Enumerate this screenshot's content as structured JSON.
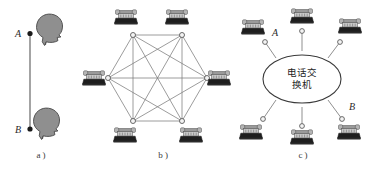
{
  "figure": {
    "title": "",
    "background_color": "#ffffff",
    "line_color": "#6e6e6e",
    "node_stroke_color": "#5a5a5a",
    "node_fill_color": "#f2f2f2",
    "head_fill_color": "#8a8a8a",
    "head_stroke_color": "#4a4a4a",
    "phone_body_color": "#1c1c1c",
    "phone_handset_color": "#b9b9b9",
    "text_color": "#2b2b2b"
  },
  "panels": [
    {
      "id": "a",
      "caption": "a )",
      "type": "point-to-point",
      "description": "Two people connected directly by a single line",
      "endpoints": [
        {
          "label": "A",
          "position": "top"
        },
        {
          "label": "B",
          "position": "bottom"
        }
      ],
      "person_count": 2,
      "link_count": 1
    },
    {
      "id": "b",
      "caption": "b )",
      "type": "full-mesh",
      "description": "Six telephones each connected to every other telephone",
      "node_count": 6,
      "link_count": 15,
      "node_labels": [
        "",
        "",
        "",
        "",
        "",
        ""
      ]
    },
    {
      "id": "c",
      "caption": "c )",
      "type": "star-switched",
      "description": "Six telephones connected to a central telephone exchange",
      "hub_label_lines": [
        "电话交",
        "换机"
      ],
      "hub_label_full": "电话交换机",
      "node_count": 6,
      "link_count": 6,
      "endpoint_labels": [
        {
          "label": "A",
          "position": "upper-left"
        },
        {
          "label": "B",
          "position": "lower-right"
        }
      ]
    }
  ]
}
